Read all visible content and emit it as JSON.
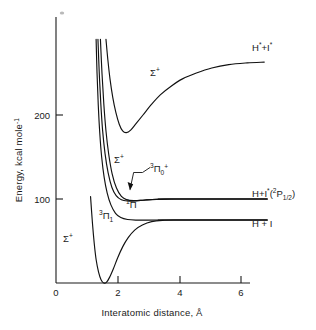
{
  "figure": {
    "kind": "potential-energy-curve-diagram",
    "background_color": "#ffffff",
    "line_color": "#111111"
  },
  "chart_data": {
    "type": "line",
    "title": "",
    "xlabel": "Interatomic distance, Å",
    "ylabel": "Energy, kcal mole⁻¹",
    "xlim": [
      0,
      7
    ],
    "ylim": [
      0,
      290
    ],
    "xticks": [
      0,
      2,
      4,
      6
    ],
    "xtick_labels": [
      "0",
      "2",
      "4",
      "6"
    ],
    "yticks": [
      100,
      200
    ],
    "ytick_labels": [
      "100",
      "200"
    ],
    "grid": false,
    "legend_position": "inline-annotations",
    "series": [
      {
        "name": "Σ⁺ (ground state)",
        "label": "Σ⁺",
        "label_x": 1.05,
        "label_y": 48,
        "dissociation_limit": 75,
        "well_minimum_x": 1.6,
        "well_minimum_y": 0,
        "points": [
          [
            1.12,
            103
          ],
          [
            1.18,
            72
          ],
          [
            1.24,
            47
          ],
          [
            1.3,
            28
          ],
          [
            1.38,
            13
          ],
          [
            1.46,
            4
          ],
          [
            1.55,
            0
          ],
          [
            1.64,
            1
          ],
          [
            1.74,
            7
          ],
          [
            1.86,
            17
          ],
          [
            2.0,
            30
          ],
          [
            2.16,
            43
          ],
          [
            2.34,
            54
          ],
          [
            2.55,
            63
          ],
          [
            2.8,
            69
          ],
          [
            3.1,
            73
          ],
          [
            3.45,
            74.6
          ],
          [
            3.9,
            75
          ],
          [
            4.5,
            75
          ],
          [
            6.85,
            75
          ]
        ]
      },
      {
        "name": "³Π₁",
        "label": "³Π₁",
        "label_x": 1.38,
        "label_y": 88,
        "dissociation_limit": 75,
        "points": [
          [
            1.3,
            290
          ],
          [
            1.33,
            250
          ],
          [
            1.37,
            212
          ],
          [
            1.42,
            178
          ],
          [
            1.48,
            150
          ],
          [
            1.56,
            126
          ],
          [
            1.66,
            107
          ],
          [
            1.78,
            93
          ],
          [
            1.93,
            83
          ],
          [
            2.1,
            78
          ],
          [
            2.32,
            75.6
          ],
          [
            2.6,
            74.9
          ],
          [
            2.95,
            74.9
          ],
          [
            3.4,
            75
          ],
          [
            4.0,
            75
          ],
          [
            5.2,
            75
          ],
          [
            6.85,
            75
          ]
        ]
      },
      {
        "name": "¹Π",
        "label": "¹Π",
        "label_x": 1.92,
        "label_y": 92,
        "dissociation_limit": 100,
        "points": [
          [
            1.36,
            290
          ],
          [
            1.4,
            252
          ],
          [
            1.45,
            215
          ],
          [
            1.51,
            182
          ],
          [
            1.59,
            154
          ],
          [
            1.69,
            131
          ],
          [
            1.81,
            114
          ],
          [
            1.95,
            104
          ],
          [
            2.12,
            99
          ],
          [
            2.32,
            97.6
          ],
          [
            2.58,
            97.8
          ],
          [
            2.9,
            98.8
          ],
          [
            3.25,
            99.6
          ],
          [
            3.7,
            100
          ],
          [
            4.4,
            100
          ],
          [
            5.6,
            100
          ],
          [
            6.85,
            100
          ]
        ]
      },
      {
        "name": "³Π₀⁺",
        "label": "³Π₀⁺",
        "label_x": 2.62,
        "label_y": 133,
        "dissociation_limit": 100,
        "has_leader_arrow": true,
        "points": [
          [
            1.44,
            290
          ],
          [
            1.49,
            250
          ],
          [
            1.55,
            213
          ],
          [
            1.62,
            181
          ],
          [
            1.71,
            153
          ],
          [
            1.82,
            130
          ],
          [
            1.96,
            113
          ],
          [
            2.12,
            103
          ],
          [
            2.3,
            99
          ],
          [
            2.52,
            98
          ],
          [
            2.8,
            98.5
          ],
          [
            3.12,
            99.4
          ],
          [
            3.5,
            99.9
          ],
          [
            4.0,
            100
          ],
          [
            5.0,
            100
          ],
          [
            6.85,
            100
          ]
        ]
      },
      {
        "name": "Σ⁺ (upper ion-pair)",
        "label": "Σ⁺",
        "label_x": 1.95,
        "label_y": 160,
        "dissociation_limit": 262,
        "well_minimum_x": 2.25,
        "well_minimum_y": 179,
        "points": [
          [
            1.62,
            290
          ],
          [
            1.68,
            266
          ],
          [
            1.75,
            243
          ],
          [
            1.84,
            221
          ],
          [
            1.94,
            203
          ],
          [
            2.05,
            189
          ],
          [
            2.16,
            181
          ],
          [
            2.28,
            179
          ],
          [
            2.42,
            182
          ],
          [
            2.6,
            190
          ],
          [
            2.82,
            200
          ],
          [
            3.08,
            212
          ],
          [
            3.38,
            224
          ],
          [
            3.72,
            234
          ],
          [
            4.1,
            243
          ],
          [
            4.55,
            250
          ],
          [
            5.05,
            256
          ],
          [
            5.6,
            260
          ],
          [
            6.2,
            262
          ],
          [
            6.75,
            263
          ]
        ]
      }
    ],
    "asymptote_lines": [
      {
        "name": "H + I*(²P1/2)",
        "y": 100,
        "x_start": 3.3,
        "x_end": 6.85
      },
      {
        "name": "H + I",
        "y": 75,
        "x_start": 3.3,
        "x_end": 6.85
      }
    ],
    "annotations": [
      {
        "name": "upper-sigma-label",
        "text": "Σ⁺",
        "x": 1.95,
        "y": 160
      },
      {
        "name": "top-sigma-label",
        "text": "Σ⁺",
        "x": 3.05,
        "y": 232
      },
      {
        "name": "ground-sigma-label",
        "text": "Σ⁺",
        "x": 1.05,
        "y": 48
      },
      {
        "name": "triplet-pi-0-label",
        "text": "³Π₀⁺",
        "x": 2.62,
        "y": 133
      },
      {
        "name": "singlet-pi-label",
        "text": "¹Π",
        "x": 1.92,
        "y": 92
      },
      {
        "name": "triplet-pi-1-label",
        "text": "³Π₁",
        "x": 1.38,
        "y": 88
      }
    ]
  },
  "labels": {
    "y_axis_title": "Energy, kcal mole",
    "y_axis_title_exponent": "-1",
    "x_axis_title": "Interatomic distance, Å",
    "x_ticks": [
      "0",
      "2",
      "4",
      "6"
    ],
    "y_ticks": [
      "200",
      "100"
    ],
    "sigma_plus": "Σ",
    "sigma_plus_sup": "+",
    "pi": "Π",
    "triplet_sup": "3",
    "singlet_sup": "1",
    "pi_zero_sub": "0",
    "pi_zero_sub_sup": "+",
    "pi_one_sub": "1"
  },
  "asymptote_labels": {
    "top_right": {
      "name": "h-star-plus-i-star",
      "base1": "H",
      "sup1": "*",
      "plus": "+",
      "base2": "I",
      "sup2": "*",
      "full_text": "H* + I*"
    },
    "middle_right": {
      "name": "h-plus-i-star-2p-half",
      "base1": "H",
      "plus": "+",
      "base2": "I",
      "sup2": "*",
      "paren_open": "(",
      "term_sup": "2",
      "term_letter": "P",
      "term_sub": "1/2",
      "paren_close": ")",
      "full_text": "H + I*(2P1/2)"
    },
    "lower_right": {
      "name": "h-plus-i",
      "full_text": "H + I"
    }
  }
}
